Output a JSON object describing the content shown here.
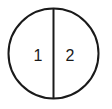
{
  "diagram": {
    "shape": "circle-divided-in-two",
    "regions": [
      {
        "label": "1"
      },
      {
        "label": "2"
      }
    ],
    "colors": {
      "stroke": "#1a1a1a",
      "background": "#ffffff"
    }
  }
}
